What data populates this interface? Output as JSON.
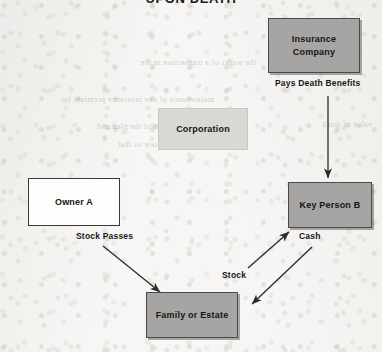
{
  "title": "UPON DEATH",
  "colors": {
    "page_background": "#f7f6f4",
    "node_gray_fill": "#a6a5a3",
    "node_light_fill": "#d9d8d5",
    "node_white_fill": "#fdfdfc",
    "border_dark": "#4c4a48",
    "text": "#141414",
    "arrow": "#2b2a28"
  },
  "nodes": [
    {
      "id": "insurance-company",
      "label": "Insurance\nCompany",
      "line1": "Insurance",
      "line2": "Company",
      "style": "gray"
    },
    {
      "id": "corporation",
      "label": "Corporation",
      "style": "light"
    },
    {
      "id": "owner-a",
      "label": "Owner A",
      "style": "white"
    },
    {
      "id": "key-person-b",
      "label": "Key Person B",
      "style": "gray"
    },
    {
      "id": "family-or-estate",
      "label": "Family or Estate",
      "style": "gray"
    }
  ],
  "edges": [
    {
      "id": "pays-death-benefits",
      "label": "Pays Death Benefits",
      "from": "insurance-company",
      "to": "key-person-b",
      "direction": "down"
    },
    {
      "id": "stock-passes",
      "label": "Stock Passes",
      "from": "owner-a",
      "to": "family-or-estate",
      "direction": "down-right"
    },
    {
      "id": "stock",
      "label": "Stock",
      "from": "family-or-estate",
      "to": "key-person-b",
      "direction": "up-right"
    },
    {
      "id": "cash",
      "label": "Cash",
      "from": "key-person-b",
      "to": "family-or-estate",
      "direction": "down-left"
    }
  ],
  "background_bleed_text": [
    "the works of a transaction in the",
    "maintenance of one insurance premium for",
    "agreement of the plan and",
    "the estate so that",
    "value of stock"
  ]
}
